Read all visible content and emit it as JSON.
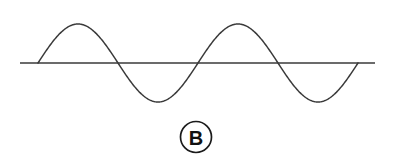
{
  "figure": {
    "label": "B",
    "label_shape": "circle",
    "background_color": "#ffffff",
    "line_color": "#3a3a3a",
    "label_color": "#111111",
    "width": 394,
    "height": 161
  },
  "chart_data": {
    "type": "line",
    "title": "",
    "subtitle": "",
    "xlabel": "",
    "ylabel": "",
    "grid": false,
    "legend": null,
    "annotations": [
      {
        "text": "B",
        "shape": "circled-letter",
        "x": 196,
        "y": 137
      }
    ],
    "axis": {
      "baseline_y": 63,
      "baseline_x_start": 20,
      "baseline_x_end": 375,
      "show_ticks": false,
      "show_labels": false
    },
    "waveform": {
      "function": "sine",
      "cycles": 2,
      "amplitude_px": 39,
      "period_px": 160,
      "phase": 0,
      "x_start": 38,
      "x_end": 358,
      "peak_y_px": 24,
      "trough_y_px": 102,
      "peaks_x_px": [
        78,
        238
      ],
      "troughs_x_px": [
        158,
        318
      ],
      "zero_crossings_x_px": [
        38,
        118,
        198,
        278,
        358
      ]
    },
    "x": [
      0,
      0.125,
      0.25,
      0.375,
      0.5,
      0.625,
      0.75,
      0.875,
      1,
      1.125,
      1.25,
      1.375,
      1.5,
      1.625,
      1.75,
      1.875,
      2
    ],
    "values": [
      0,
      0.707,
      1,
      0.707,
      0,
      -0.707,
      -1,
      -0.707,
      0,
      0.707,
      1,
      0.707,
      0,
      -0.707,
      -1,
      -0.707,
      0
    ],
    "xlim": [
      0,
      2
    ],
    "ylim": [
      -1,
      1
    ]
  }
}
